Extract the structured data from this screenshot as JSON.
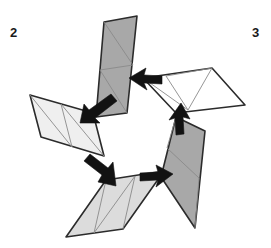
{
  "figure": {
    "background_color": "#ffffff",
    "width": 271,
    "height": 248
  },
  "labels": [
    {
      "id": "label-2",
      "text": "2",
      "x": 10,
      "y": 37,
      "name": "figure-label-2"
    },
    {
      "id": "label-3",
      "text": "3",
      "x": 252,
      "y": 37,
      "name": "figure-label-3"
    }
  ],
  "colors": {
    "dark_gray_fill": "#a8a8a8",
    "mid_gray_fill": "#dcdcdc",
    "light_gray_fill": "#efefef",
    "white_fill": "#ffffff",
    "outline_stroke": "#2b2b2b",
    "inner_stroke": "#8a8a8a",
    "arrow_fill": "#121212",
    "label_color": "#1a1a1a"
  },
  "strips": [
    {
      "id": "strip-top-dark",
      "name": "triangle-strip-top-dark",
      "fill_name": "dark_gray_fill",
      "fill": "#a8a8a8",
      "triangle_count": 4,
      "orientation": "upper-center, tilted down-left",
      "outline": "96,117 104,22 137,16 127,113",
      "inner_lines": [
        "100,70 133,65",
        "104,22 133,65",
        "100,70 127,113"
      ]
    },
    {
      "id": "strip-left-light",
      "name": "triangle-strip-left-light",
      "fill_name": "light_gray_fill",
      "fill": "#efefef",
      "triangle_count": 4,
      "orientation": "left, tilted down-right",
      "outline": "30,95 93,113 104,156 41,137",
      "inner_lines": [
        "61,104 72,147",
        "30,95 72,147",
        "61,104 104,156"
      ]
    },
    {
      "id": "strip-bottom-mid",
      "name": "triangle-strip-bottom-mid",
      "fill_name": "mid_gray_fill",
      "fill": "#dcdcdc",
      "triangle_count": 4,
      "orientation": "bottom-center, tilted up-right",
      "outline": "106,180 164,171 123,229 66,237",
      "inner_lines": [
        "135,176 94,233",
        "106,180 94,233",
        "135,176 123,229"
      ]
    },
    {
      "id": "strip-right-dark",
      "name": "triangle-strip-right-dark",
      "fill_name": "dark_gray_fill",
      "fill": "#a8a8a8",
      "triangle_count": 4,
      "orientation": "lower-right, tilted down-left",
      "outline": "176,117 205,131 195,228 161,177",
      "inner_lines": [
        "167,148 199,178",
        "176,117 167,148",
        "199,178 195,228"
      ]
    },
    {
      "id": "strip-top-white",
      "name": "triangle-strip-top-white",
      "fill_name": "white_fill",
      "fill": "#ffffff",
      "triangle_count": 4,
      "orientation": "upper-right, near horizontal",
      "outline": "143,78 212,68 245,105 176,113",
      "inner_lines": [
        "166,76 188,110",
        "143,78 188,110",
        "166,76 212,68",
        "212,68 188,110"
      ]
    }
  ],
  "arrows": [
    {
      "id": "arrow-white-to-topdark",
      "name": "arrow-white-to-top-dark-strip",
      "direction": "left",
      "from_strip": "strip-top-white",
      "to_strip": "strip-top-dark",
      "tip_x": 129,
      "tip_y": 78,
      "tail_x": 160,
      "tail_y": 80,
      "polygon": "129,78 146,68 144,75 162,76 162,84 144,83 147,90"
    },
    {
      "id": "arrow-topdark-to-left",
      "name": "arrow-top-dark-to-left-strip",
      "direction": "down-left",
      "from_strip": "strip-top-dark",
      "to_strip": "strip-left-light",
      "tip_x": 80,
      "tip_y": 123,
      "tail_x": 112,
      "tail_y": 99,
      "polygon": "80,123 84,104 89,110 111,94 117,101 95,118 100,123"
    },
    {
      "id": "arrow-left-to-bottom",
      "name": "arrow-left-to-bottom-strip",
      "direction": "down-right",
      "from_strip": "strip-left-light",
      "to_strip": "strip-bottom-mid",
      "tip_x": 116,
      "tip_y": 186,
      "tail_x": 90,
      "tail_y": 157,
      "polygon": "116,186 98,182 102,175 84,161 90,154 108,168 113,162"
    },
    {
      "id": "arrow-bottom-to-rightdark",
      "name": "arrow-bottom-to-right-dark-strip",
      "direction": "right",
      "from_strip": "strip-bottom-mid",
      "to_strip": "strip-right-dark",
      "tip_x": 173,
      "tip_y": 174,
      "tail_x": 143,
      "tail_y": 177,
      "polygon": "173,174 156,165 158,172 140,173 140,181 158,180 156,187"
    },
    {
      "id": "arrow-rightdark-to-white",
      "name": "arrow-right-dark-to-white-strip",
      "direction": "up",
      "from_strip": "strip-right-dark",
      "to_strip": "strip-top-white",
      "tip_x": 181,
      "tip_y": 103,
      "tail_x": 182,
      "tail_y": 133,
      "polygon": "181,103 190,119 183,117 184,134 176,135 175,118 169,120"
    }
  ]
}
